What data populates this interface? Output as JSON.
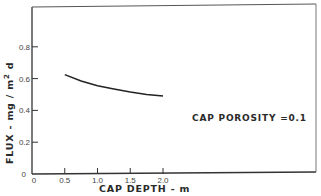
{
  "chart_data": {
    "type": "line",
    "title": "",
    "xlabel": "CAP DEPTH - m",
    "ylabel": "FLUX - mg/m²d",
    "ylabel_parts": {
      "main": "FLUX - mg / m",
      "sup": "2",
      "tail": " d"
    },
    "xlim": [
      0,
      2.0
    ],
    "ylim": [
      0,
      1.04
    ],
    "x_ticks": [
      0,
      0.5,
      1.0,
      1.5,
      2.0
    ],
    "x_tick_labels": [
      "0",
      "0.5",
      "1.0",
      "1.5",
      "2.0"
    ],
    "y_ticks": [
      0,
      0.2,
      0.4,
      0.6,
      0.8
    ],
    "y_tick_labels": [
      "0",
      "0.2",
      "0.4",
      "0.6",
      "0.8"
    ],
    "grid": false,
    "legend": null,
    "annotations": [
      {
        "text": "CAP POROSITY =0.1",
        "x": 2.45,
        "y": 0.39
      }
    ],
    "series": [
      {
        "name": "CAP POROSITY = 0.1",
        "x": [
          0.5,
          0.75,
          1.0,
          1.25,
          1.5,
          1.75,
          2.0
        ],
        "y": [
          0.625,
          0.585,
          0.555,
          0.535,
          0.515,
          0.5,
          0.49
        ]
      }
    ]
  }
}
